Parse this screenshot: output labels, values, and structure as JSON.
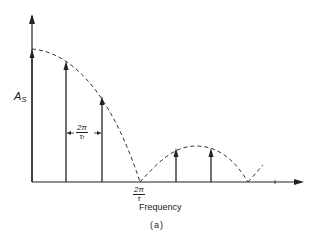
{
  "figure": {
    "y_axis_label": "A",
    "y_axis_label_sub": "S",
    "x_axis_label": "Frequency",
    "caption": "(a)",
    "spacing_label": {
      "num": "2π",
      "den": "τ",
      "den_sub": "r"
    },
    "zero_label": {
      "num": "2π",
      "den": "τ"
    }
  },
  "colors": {
    "line": "#222222",
    "background": "#ffffff"
  },
  "spectral_lines": [
    {
      "x": 32,
      "top": 50
    },
    {
      "x": 66,
      "top": 63
    },
    {
      "x": 102,
      "top": 98
    },
    {
      "x": 176,
      "top": 150
    },
    {
      "x": 211,
      "top": 150
    }
  ]
}
